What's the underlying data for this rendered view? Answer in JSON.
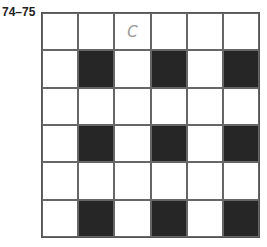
{
  "label": "74–75",
  "grid": {
    "rows": 6,
    "cols": 6,
    "cells": [
      [
        {
          "shade": "white",
          "text": ""
        },
        {
          "shade": "white",
          "text": ""
        },
        {
          "shade": "white",
          "text": "C"
        },
        {
          "shade": "white",
          "text": ""
        },
        {
          "shade": "white",
          "text": ""
        },
        {
          "shade": "white",
          "text": ""
        }
      ],
      [
        {
          "shade": "white",
          "text": ""
        },
        {
          "shade": "dark",
          "text": ""
        },
        {
          "shade": "white",
          "text": ""
        },
        {
          "shade": "dark",
          "text": ""
        },
        {
          "shade": "white",
          "text": ""
        },
        {
          "shade": "dark",
          "text": ""
        }
      ],
      [
        {
          "shade": "white",
          "text": ""
        },
        {
          "shade": "white",
          "text": ""
        },
        {
          "shade": "white",
          "text": ""
        },
        {
          "shade": "white",
          "text": ""
        },
        {
          "shade": "white",
          "text": ""
        },
        {
          "shade": "white",
          "text": ""
        }
      ],
      [
        {
          "shade": "white",
          "text": ""
        },
        {
          "shade": "dark",
          "text": ""
        },
        {
          "shade": "white",
          "text": ""
        },
        {
          "shade": "dark",
          "text": ""
        },
        {
          "shade": "white",
          "text": ""
        },
        {
          "shade": "dark",
          "text": ""
        }
      ],
      [
        {
          "shade": "white",
          "text": ""
        },
        {
          "shade": "white",
          "text": ""
        },
        {
          "shade": "white",
          "text": ""
        },
        {
          "shade": "white",
          "text": ""
        },
        {
          "shade": "white",
          "text": ""
        },
        {
          "shade": "white",
          "text": ""
        }
      ],
      [
        {
          "shade": "white",
          "text": ""
        },
        {
          "shade": "dark",
          "text": ""
        },
        {
          "shade": "white",
          "text": ""
        },
        {
          "shade": "dark",
          "text": ""
        },
        {
          "shade": "white",
          "text": ""
        },
        {
          "shade": "dark",
          "text": ""
        }
      ]
    ]
  },
  "colors": {
    "dark": "#262626",
    "light": "#ffffff",
    "grid_line": "#666666",
    "letter": "#9a9a9a"
  }
}
